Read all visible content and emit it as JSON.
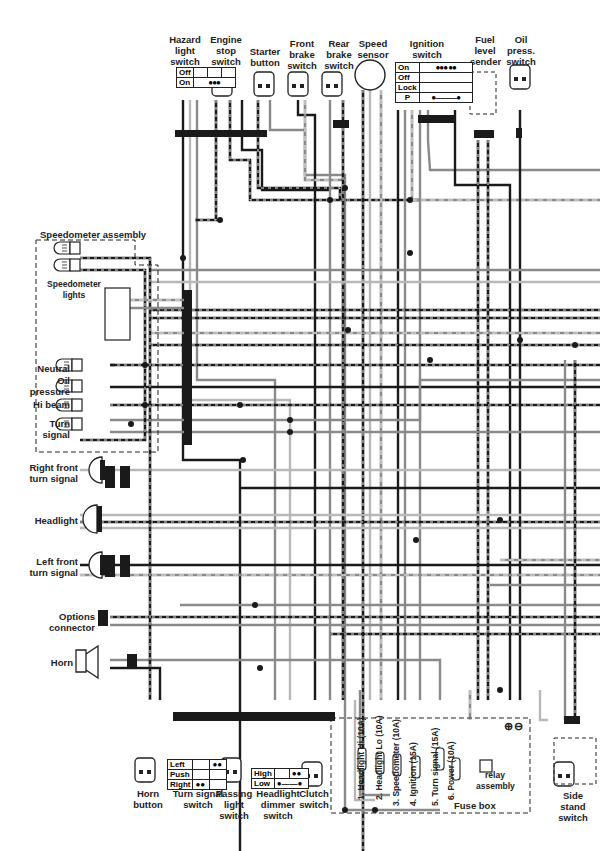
{
  "components": {
    "hazard": {
      "label": [
        "Hazard",
        "light",
        "switch"
      ],
      "table": [
        [
          "Off",
          ""
        ],
        [
          "On",
          "●●●"
        ]
      ]
    },
    "engine_stop": {
      "label": [
        "Engine",
        "stop",
        "switch"
      ]
    },
    "starter": {
      "label": [
        "Starter",
        "button"
      ]
    },
    "front_brake": {
      "label": [
        "Front",
        "brake",
        "switch"
      ]
    },
    "rear_brake": {
      "label": [
        "Rear",
        "brake",
        "switch"
      ]
    },
    "speed_sensor": {
      "label": [
        "Speed",
        "sensor"
      ]
    },
    "ignition": {
      "label": [
        "Ignition",
        "switch"
      ],
      "table": [
        [
          "On",
          "●●●  ●●"
        ],
        [
          "Off",
          ""
        ],
        [
          "Lock",
          ""
        ],
        [
          "P",
          "●———●"
        ]
      ]
    },
    "fuel_sender": {
      "label": [
        "Fuel",
        "level",
        "sender"
      ]
    },
    "oil_press": {
      "label": [
        "Oil",
        "press.",
        "switch"
      ]
    },
    "speedo_assembly": {
      "label": "Speedometer assembly",
      "lights_label": [
        "Speedometer",
        "lights"
      ]
    },
    "neutral": {
      "label": "Neutral"
    },
    "oil_pressure": {
      "label": [
        "Oil",
        "pressure"
      ]
    },
    "hi_beam": {
      "label": "Hi beam"
    },
    "turn_ind": {
      "label": [
        "Turn",
        "signal"
      ]
    },
    "rf_turn": {
      "label": [
        "Right front",
        "turn signal"
      ]
    },
    "headlight": {
      "label": "Headlight"
    },
    "lf_turn": {
      "label": [
        "Left front",
        "turn signal"
      ]
    },
    "options": {
      "label": [
        "Options",
        "connector"
      ]
    },
    "horn": {
      "label": "Horn"
    },
    "horn_button": {
      "label": [
        "Horn",
        "button"
      ]
    },
    "turn_switch": {
      "label": [
        "Turn signal",
        "switch"
      ],
      "table": [
        [
          "Left",
          "",
          "●●"
        ],
        [
          "Push",
          "",
          ""
        ],
        [
          "Right",
          "●●",
          ""
        ]
      ]
    },
    "passing": {
      "label": [
        "Passing",
        "light",
        "switch"
      ]
    },
    "dimmer": {
      "label": [
        "Headlight",
        "dimmer",
        "switch"
      ],
      "table": [
        [
          "High",
          "",
          "●●"
        ],
        [
          "Low",
          "●——●",
          ""
        ]
      ]
    },
    "clutch": {
      "label": [
        "Clutch",
        "switch"
      ]
    },
    "fuse_box": {
      "label": "Fuse box",
      "fuses": [
        "1. Headlight Hi (10A)",
        "2. Headlight Lo (10A)",
        "3. Speedometer (10A)",
        "4. Ignition (15A)",
        "5. Turn signal (15A)",
        "6. Power (10A)"
      ]
    },
    "relay": {
      "label": [
        "relay",
        "assembly"
      ]
    },
    "battery_terms": {
      "plus": "⊕",
      "minus": "⊖"
    },
    "side_stand": {
      "label": [
        "Side",
        "stand",
        "switch"
      ]
    }
  },
  "colors": {
    "ink": "#222222",
    "gray": "#8a8a8a",
    "light": "#b8b8b8",
    "dark": "#1a1a1a"
  }
}
